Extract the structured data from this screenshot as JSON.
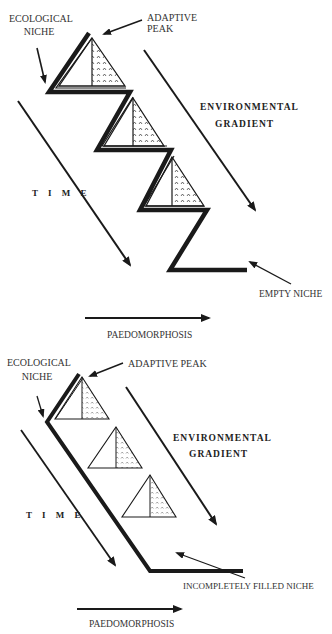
{
  "diagrams": [
    {
      "id": "top",
      "labels": {
        "ecological_niche_1": "ECOLOGICAL",
        "ecological_niche_2": "NICHE",
        "adaptive_peak_1": "ADAPTIVE",
        "adaptive_peak_2": "PEAK",
        "environmental_1": "ENVIRONMENTAL",
        "environmental_2": "GRADIENT",
        "time": "T I M E",
        "empty_niche": "EMPTY NICHE",
        "paedomorphosis": "PAEDOMORPHOSIS"
      },
      "triangles": 3,
      "niche_path": "zigzag"
    },
    {
      "id": "bottom",
      "labels": {
        "ecological_niche_1": "ECOLOGICAL",
        "ecological_niche_2": "NICHE",
        "adaptive_peak": "ADAPTIVE PEAK",
        "environmental_1": "ENVIRONMENTAL",
        "environmental_2": "GRADIENT",
        "time": "T I M E",
        "incompletely_filled_niche": "INCOMPLETELY FILLED NICHE",
        "paedomorphosis": "PAEDOMORPHOSIS"
      },
      "triangles": 3,
      "niche_path": "straight-diagonal"
    }
  ],
  "colors": {
    "ink": "#1a1a1a",
    "text": "#333333",
    "background": "#ffffff"
  }
}
